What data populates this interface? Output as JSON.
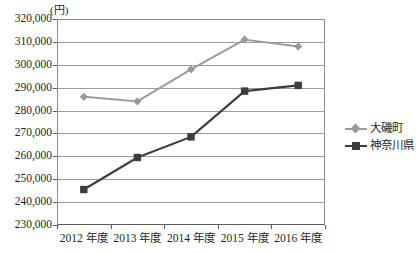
{
  "chart_data": {
    "type": "line",
    "title": "",
    "subtitle": "",
    "unit_label": "(円)",
    "xlabel": "",
    "ylabel": "",
    "categories": [
      "2012 年度",
      "2013 年度",
      "2014 年度",
      "2015 年度",
      "2016 年度"
    ],
    "ylim": [
      230000,
      320000
    ],
    "ytick_step": 10000,
    "ytick_labels": [
      "320,000",
      "310,000",
      "300,000",
      "290,000",
      "280,000",
      "270,000",
      "260,000",
      "250,000",
      "240,000",
      "230,000"
    ],
    "ytick_values": [
      320000,
      310000,
      300000,
      290000,
      280000,
      270000,
      260000,
      250000,
      240000,
      230000
    ],
    "grid": true,
    "legend_position": "right",
    "series": [
      {
        "name": "大磯町",
        "color": "#9a9a9a",
        "marker": "diamond",
        "values": [
          286000,
          284000,
          298000,
          311000,
          308000
        ]
      },
      {
        "name": "神奈川県",
        "color": "#3d3d3d",
        "marker": "square",
        "values": [
          245500,
          259500,
          268500,
          288500,
          291000
        ]
      }
    ]
  },
  "legend": {
    "items": [
      {
        "label": "大磯町"
      },
      {
        "label": "神奈川県"
      }
    ]
  },
  "colors": {
    "series_oiso": "#9a9a9a",
    "series_kanagawa": "#3d3d3d",
    "gridline": "#9d9d9d",
    "axis": "#5a5a5a",
    "text": "#231f20",
    "background": "#ffffff"
  }
}
